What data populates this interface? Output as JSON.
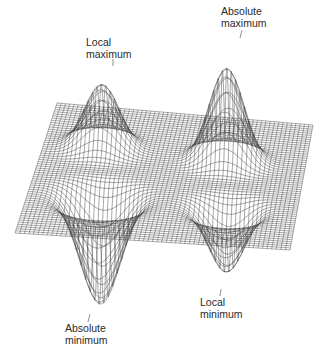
{
  "figure": {
    "mesh_color": "#3a3a3a",
    "background": "#ffffff",
    "annotations": [
      {
        "id": "local-maximum",
        "line1": "Local",
        "line2": "maximum"
      },
      {
        "id": "absolute-maximum",
        "line1": "Absolute",
        "line2": "maximum"
      },
      {
        "id": "absolute-minimum",
        "line1": "Absolute",
        "line2": "minimum"
      },
      {
        "id": "local-minimum",
        "line1": "Local",
        "line2": "minimum"
      }
    ]
  }
}
